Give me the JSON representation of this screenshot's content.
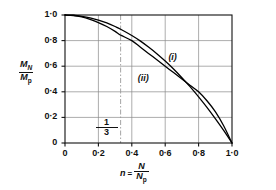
{
  "chart_data": {
    "type": "line",
    "title": "",
    "xlabel": "n = N/Np",
    "ylabel": "MN/Mp",
    "xlim": [
      0,
      1
    ],
    "ylim": [
      0,
      1
    ],
    "grid": true,
    "legend_position": "inline-annotation",
    "xticks": [
      "0",
      "0·2",
      "0·4",
      "0·6",
      "0·8",
      "1·0"
    ],
    "xtick_values": [
      0,
      0.2,
      0.4,
      0.6,
      0.8,
      1.0
    ],
    "yticks": [
      "0",
      "0·2",
      "0·4",
      "0·6",
      "0·8",
      "1·0"
    ],
    "ytick_values": [
      0,
      0.2,
      0.4,
      0.6,
      0.8,
      1.0
    ],
    "annotations": [
      {
        "text": "1/3",
        "x": 0.333,
        "y": 0.12,
        "style": "fraction"
      },
      {
        "text": "(i)",
        "x": 0.655,
        "y": 0.66,
        "style": "italic"
      },
      {
        "text": "(ii)",
        "x": 0.49,
        "y": 0.495,
        "style": "italic"
      }
    ],
    "reference_lines": [
      {
        "orientation": "vertical",
        "x": 0.333,
        "style": "dash-dot",
        "label": "1/3"
      }
    ],
    "series": [
      {
        "name": "(i)",
        "x": [
          0.0,
          0.05,
          0.1,
          0.15,
          0.2,
          0.25,
          0.3,
          0.3333,
          0.4,
          0.45,
          0.5,
          0.55,
          0.6,
          0.65,
          0.7,
          0.75,
          0.8,
          0.85,
          0.9,
          0.95,
          1.0
        ],
        "values": [
          1.0,
          0.998,
          0.99,
          0.978,
          0.96,
          0.938,
          0.91,
          0.889,
          0.84,
          0.798,
          0.75,
          0.698,
          0.64,
          0.578,
          0.51,
          0.438,
          0.36,
          0.278,
          0.19,
          0.098,
          0.0
        ]
      },
      {
        "name": "(ii)",
        "x": [
          0.0,
          0.05,
          0.1,
          0.15,
          0.2,
          0.25,
          0.3,
          0.3333,
          0.4,
          0.45,
          0.5,
          0.55,
          0.6,
          0.65,
          0.7,
          0.75,
          0.8,
          0.85,
          0.9,
          0.95,
          1.0
        ],
        "values": [
          1.0,
          0.996,
          0.985,
          0.966,
          0.941,
          0.91,
          0.872,
          0.843,
          0.8,
          0.75,
          0.7,
          0.65,
          0.6,
          0.55,
          0.5,
          0.45,
          0.4,
          0.33,
          0.245,
          0.135,
          0.0
        ]
      }
    ]
  },
  "axes": {
    "ylabel_numerator": "M",
    "ylabel_numerator_sub": "N",
    "ylabel_denominator": "M",
    "ylabel_denominator_sub": "p",
    "xlabel_var": "n",
    "xlabel_eq": "=",
    "xlabel_numerator": "N",
    "xlabel_denominator": "N",
    "xlabel_denominator_sub": "p"
  },
  "annotation_third": {
    "numerator": "1",
    "denominator": "3"
  },
  "curve_labels": {
    "upper": "(i)",
    "lower": "(ii)"
  },
  "colors": {
    "axis": "#111111",
    "grid": "#8a8a8a",
    "curve": "#000000",
    "reference_line": "#9a9a9a",
    "background": "#ffffff"
  }
}
